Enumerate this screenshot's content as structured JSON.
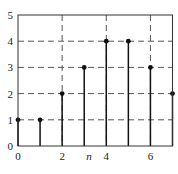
{
  "chart_data": {
    "type": "stem",
    "title": "",
    "xlabel": "n",
    "ylabel": "",
    "x": [
      0,
      1,
      2,
      3,
      4,
      5,
      6,
      7
    ],
    "values": [
      1,
      1,
      2,
      3,
      4,
      4,
      3,
      2
    ],
    "xlim": [
      0,
      7
    ],
    "ylim": [
      0,
      5
    ],
    "xticks": [
      0,
      2,
      4,
      6
    ],
    "yticks": [
      0,
      1,
      2,
      3,
      4,
      5
    ],
    "grid": true,
    "grid_style": "dashed",
    "colors": {
      "stem": "#111111",
      "axes": "#333333",
      "grid": "#555555"
    }
  }
}
